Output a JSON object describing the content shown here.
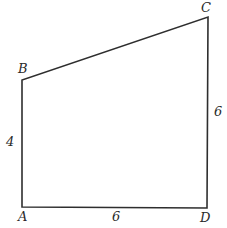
{
  "diagram": {
    "type": "quadrilateral",
    "vertices": [
      {
        "name": "A",
        "x": 22,
        "y": 207
      },
      {
        "name": "B",
        "x": 22,
        "y": 80
      },
      {
        "name": "C",
        "x": 208,
        "y": 17
      },
      {
        "name": "D",
        "x": 207,
        "y": 208
      }
    ],
    "labels": {
      "A": "A",
      "B": "B",
      "C": "C",
      "D": "D",
      "AB": "4",
      "AD": "6",
      "CD": "6"
    }
  }
}
